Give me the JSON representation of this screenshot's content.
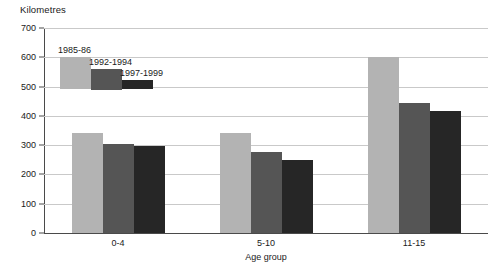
{
  "chart_data": {
    "type": "bar",
    "title": "",
    "xlabel": "Age group",
    "ylabel": "Kilometres",
    "categories": [
      "0-4",
      "5-10",
      "11-15"
    ],
    "series": [
      {
        "name": "1985-86",
        "color": "#b3b3b3",
        "values": [
          340,
          340,
          600
        ]
      },
      {
        "name": "1992-1994",
        "color": "#555555",
        "values": [
          305,
          277,
          445
        ]
      },
      {
        "name": "1997-1999",
        "color": "#262626",
        "values": [
          297,
          250,
          418
        ]
      }
    ],
    "ylim": [
      0,
      700
    ],
    "ytick_step": 100,
    "yticks": [
      "0",
      "100",
      "200",
      "300",
      "400",
      "500",
      "600",
      "700"
    ],
    "grid": true,
    "legend_position": "upper-left-inside"
  },
  "axis": {
    "y_title": "Kilometres",
    "x_title": "Age group"
  },
  "colors": {
    "gridline": "#c9c9c9",
    "axis": "#4a4a4a",
    "background": "#ffffff",
    "text": "#1a1a1a"
  }
}
